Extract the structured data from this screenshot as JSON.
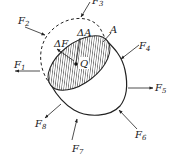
{
  "figure": {
    "section_label": "A",
    "point_label": "Q",
    "area_element_label": "ΔA",
    "force_element_label": "ΔF",
    "forces": [
      {
        "name": "F",
        "index": "1"
      },
      {
        "name": "F",
        "index": "2"
      },
      {
        "name": "F",
        "index": "3"
      },
      {
        "name": "F",
        "index": "4"
      },
      {
        "name": "F",
        "index": "5"
      },
      {
        "name": "F",
        "index": "6"
      },
      {
        "name": "F",
        "index": "7"
      },
      {
        "name": "F",
        "index": "8"
      }
    ],
    "colors": {
      "line": "#222222",
      "hatch": "#444444",
      "background": "#ffffff"
    }
  }
}
